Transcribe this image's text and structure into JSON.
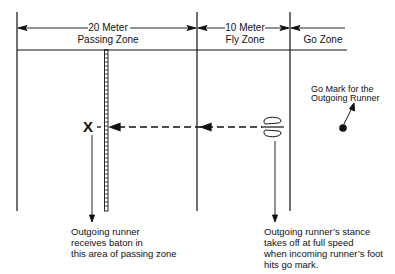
{
  "diagram": {
    "zones": [
      {
        "distance": "20 Meter",
        "name": "Passing Zone"
      },
      {
        "distance": "10 Meter",
        "name": "Fly Zone"
      },
      {
        "distance": "",
        "name": "Go Zone"
      }
    ],
    "markers": {
      "baton_exchange": "X",
      "go_mark_label_line1": "Go Mark for the",
      "go_mark_label_line2": "Outgoing Runner"
    },
    "annotations": {
      "left": [
        "Outgoing runner",
        "receives baton in",
        "this area of passing zone"
      ],
      "right": [
        "Outgoing runner’s stance",
        "takes off at full speed",
        "when incoming runner’s foot",
        "hits go mark."
      ]
    },
    "colors": {
      "line": "#111111",
      "background": "#ffffff"
    }
  }
}
